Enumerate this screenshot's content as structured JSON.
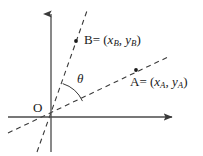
{
  "figure": {
    "background_color": "#ffffff",
    "stroke_color": "#3a3a3a",
    "text_color": "#1a1a1a",
    "width": 203,
    "height": 156
  },
  "axes": {
    "origin_label": "O",
    "x_axis_name": "x-axis",
    "y_axis_name": "y-axis",
    "origin": {
      "x": 51,
      "y": 117
    },
    "x_axis": {
      "x1": 8,
      "y1": 117,
      "x2": 178,
      "y2": 117,
      "arrow": "right"
    },
    "y_axis": {
      "x1": 51,
      "y1": 152,
      "x2": 51,
      "y2": 8,
      "arrow": "up"
    }
  },
  "angle": {
    "symbol": "θ",
    "arc_radius": 33,
    "between": [
      "ray-to-B",
      "ray-to-A"
    ]
  },
  "points": [
    {
      "id": "B",
      "name": "point-b",
      "label_prefix": "B",
      "equals": "=",
      "open_paren": "(",
      "x_var": "x",
      "x_sub": "B",
      "comma": ",",
      "y_var": "y",
      "y_sub": "B",
      "close_paren": ")",
      "dot": {
        "x": 76,
        "y": 41
      },
      "ray": {
        "x1": 37,
        "y1": 152,
        "x2": 88,
        "y2": 8
      }
    },
    {
      "id": "A",
      "name": "point-a",
      "label_prefix": "A",
      "equals": "=",
      "open_paren": "(",
      "x_var": "x",
      "x_sub": "A",
      "comma": ",",
      "y_var": "y",
      "y_sub": "A",
      "close_paren": ")",
      "dot": {
        "x": 136,
        "y": 70
      },
      "ray": {
        "x1": 8,
        "y1": 133,
        "x2": 168,
        "y2": 57
      }
    }
  ]
}
